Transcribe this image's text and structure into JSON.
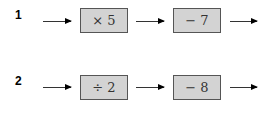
{
  "rows": [
    {
      "label": "1",
      "operations": [
        "× 5",
        "− 7"
      ]
    },
    {
      "label": "2",
      "operations": [
        "÷ 2",
        "− 8"
      ]
    }
  ]
}
